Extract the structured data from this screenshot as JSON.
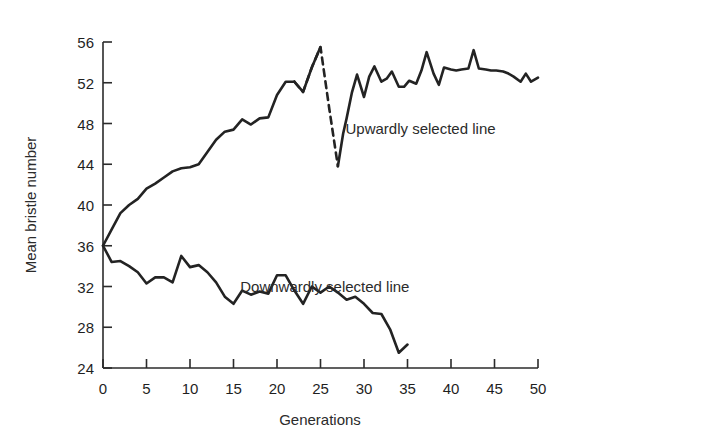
{
  "chart_data": {
    "type": "line",
    "title": "",
    "xlabel": "Generations",
    "ylabel": "Mean bristle number",
    "xlim": [
      0,
      50
    ],
    "ylim": [
      24,
      56
    ],
    "xticks": [
      0,
      5,
      10,
      15,
      20,
      25,
      30,
      35,
      40,
      45,
      50
    ],
    "xtick_labels": [
      "0",
      "5",
      "10",
      "15",
      "20",
      "25",
      "30",
      "35",
      "40",
      "45",
      "50"
    ],
    "yticks": [
      24,
      28,
      32,
      36,
      40,
      44,
      48,
      52,
      56
    ],
    "ytick_labels": [
      "24",
      "28",
      "32",
      "36",
      "40",
      "44",
      "48",
      "52",
      "56"
    ],
    "grid": false,
    "legend_position": "inline-annotation",
    "series": [
      {
        "name": "Upwardly selected line",
        "label": "Upwardly selected line",
        "color": "#232323",
        "style": "solid",
        "annotation_x": 36.5,
        "annotation_y": 47.0,
        "x": [
          0,
          1,
          2,
          3,
          4,
          5,
          6,
          7,
          8,
          9,
          10,
          11,
          12,
          13,
          14,
          15,
          16,
          17,
          18,
          19,
          20,
          21,
          22
        ],
        "values": [
          36.0,
          37.6,
          39.2,
          40.0,
          40.6,
          41.6,
          42.1,
          42.7,
          43.3,
          43.6,
          43.7,
          44.0,
          45.2,
          46.4,
          47.2,
          47.4,
          48.4,
          47.9,
          48.5,
          48.6,
          50.8,
          52.1,
          52.1
        ]
      },
      {
        "name": "Upwardly selected line (relaxed, dashed)",
        "label": "",
        "color": "#232323",
        "style": "dashed",
        "x": [
          22,
          23,
          24,
          25,
          26,
          27
        ],
        "values": [
          52.1,
          51.1,
          53.5,
          55.5,
          49.5,
          43.8
        ]
      },
      {
        "name": "Upwardly selected line (continued)",
        "label": "",
        "color": "#232323",
        "style": "solid",
        "x": [
          22,
          23,
          24,
          25
        ],
        "values": [
          52.1,
          51.1,
          53.5,
          55.5
        ]
      },
      {
        "name": "Upwardly selected line (recovery)",
        "label": "",
        "color": "#232323",
        "style": "solid",
        "x": [
          27,
          27.6,
          28,
          28.6,
          29.2,
          30,
          30.6,
          31.2,
          32,
          32.6,
          33.2,
          34,
          34.6,
          35.2,
          36,
          36.6,
          37.2,
          38,
          38.6,
          39.2,
          40,
          40.6,
          41.2,
          42,
          42.6,
          43.2,
          44,
          44.6,
          45.2,
          46,
          46.6,
          47.2,
          48,
          48.6,
          49.2,
          50
        ],
        "values": [
          43.8,
          47.0,
          48.5,
          51.0,
          52.8,
          50.6,
          52.6,
          53.6,
          52.1,
          52.4,
          53.1,
          51.6,
          51.6,
          52.2,
          51.9,
          53.2,
          55.0,
          52.9,
          51.8,
          53.5,
          53.3,
          53.2,
          53.3,
          53.4,
          55.2,
          53.4,
          53.3,
          53.2,
          53.2,
          53.1,
          52.9,
          52.6,
          52.1,
          52.9,
          52.1,
          52.5
        ]
      },
      {
        "name": "Downwardly selected line",
        "label": "Downwardly selected line",
        "color": "#232323",
        "style": "solid",
        "annotation_x": 25.5,
        "annotation_y": 31.5,
        "x": [
          0,
          1,
          2,
          3,
          4,
          5,
          6,
          7,
          8,
          9,
          10,
          11,
          12,
          13,
          14,
          15,
          16,
          17,
          18,
          19,
          20,
          21,
          22,
          23,
          24,
          25,
          26,
          27,
          28,
          29,
          30,
          31,
          32,
          33,
          34,
          35
        ],
        "values": [
          36.0,
          34.4,
          34.5,
          34.0,
          33.4,
          32.3,
          32.9,
          32.9,
          32.4,
          35.0,
          33.9,
          34.1,
          33.4,
          32.4,
          31.0,
          30.3,
          31.6,
          31.2,
          31.5,
          31.3,
          33.1,
          33.1,
          31.6,
          30.3,
          32.0,
          31.4,
          32.0,
          31.4,
          30.7,
          31.0,
          30.3,
          29.4,
          29.3,
          27.8,
          25.5,
          26.3
        ]
      }
    ]
  }
}
